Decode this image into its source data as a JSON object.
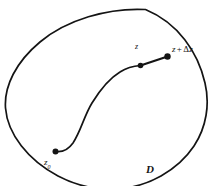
{
  "figure": {
    "kind": "complex-analysis-domain-diagram",
    "background_color": "#ffffff",
    "ink_color": "#141414",
    "width": 213,
    "height": 186,
    "labels": {
      "domain": "D",
      "start_point": "z",
      "start_point_subscript": "0",
      "current_point": "z",
      "increment_point_base": "z",
      "increment_point_operator": "+",
      "increment_point_delta": "Δ",
      "increment_point_variable": "z"
    },
    "geometry": {
      "domain_boundary_path": "M 145.5 9.5 C 108 7.5 66 20 40 42 C 16 62 4 86 5.5 108 C 7.5 134 28 160 58 176 C 76 185.5 96 190 116 189 C 148 187.5 178 170 194 146 C 206.5 127 210 104 205 83 C 198 52 178 23 145.5 9.5 Z",
      "curve_path": "M 55.5 151.5 C 62 152.5 68 150 73 143 C 81 131 84 116 92 103 C 100 90 110 78 120 72 C 127 67.5 134 66 140.5 65.5",
      "segment_path": "M 140.5 65.5 L 167.5 56.5",
      "points": [
        {
          "name": "z0",
          "x": 55.5,
          "y": 151.5,
          "r": 3.0
        },
        {
          "name": "z",
          "x": 140.5,
          "y": 65.5,
          "r": 2.8
        },
        {
          "name": "z_plus_dz",
          "x": 167.5,
          "y": 56.5,
          "r": 3.2
        }
      ],
      "boundary_stroke_width": 1.7,
      "curve_stroke_width": 1.7,
      "segment_stroke_width": 2.2
    }
  }
}
